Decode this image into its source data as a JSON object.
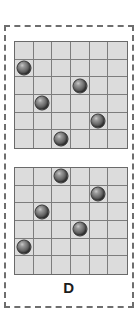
{
  "panel": {
    "label": "D",
    "border_style": "dashed",
    "border_color": "#6e6e6e"
  },
  "colors": {
    "grid_fill": "#dcdcdc",
    "grid_line": "#7d7d7d",
    "grid_border": "#6a6a6a",
    "ball_dark": "#343434",
    "ball_light": "#c9c9c9",
    "background": "#ffffff",
    "label_text": "#1c1c1c"
  },
  "chart_data": {
    "type": "scatter",
    "title": "D",
    "grid": true,
    "grids": [
      {
        "name": "top-grid",
        "rows": 6,
        "cols": 6,
        "marker": "sphere",
        "points": [
          {
            "col": 0,
            "row": 1
          },
          {
            "col": 3,
            "row": 2
          },
          {
            "col": 1,
            "row": 3
          },
          {
            "col": 4,
            "row": 4
          },
          {
            "col": 2,
            "row": 5
          }
        ]
      },
      {
        "name": "bottom-grid",
        "rows": 6,
        "cols": 6,
        "marker": "sphere",
        "points": [
          {
            "col": 2,
            "row": 0
          },
          {
            "col": 4,
            "row": 1
          },
          {
            "col": 1,
            "row": 2
          },
          {
            "col": 3,
            "row": 3
          },
          {
            "col": 0,
            "row": 4
          }
        ]
      }
    ]
  }
}
